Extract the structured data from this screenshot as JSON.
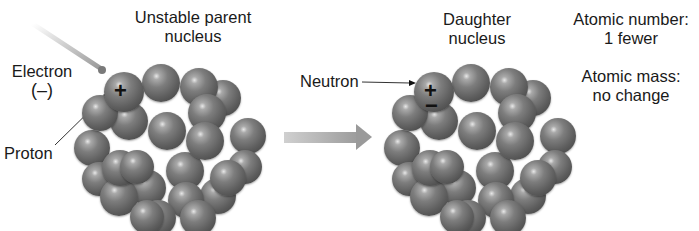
{
  "diagram": {
    "labels": {
      "parent_line1": "Unstable parent",
      "parent_line2": "nucleus",
      "electron_line1": "Electron",
      "electron_line2": "(–)",
      "proton": "Proton",
      "daughter_line1": "Daughter",
      "daughter_line2": "nucleus",
      "neutron": "Neutron",
      "atomic_number_line1": "Atomic number:",
      "atomic_number_line2": "1 fewer",
      "atomic_mass_line1": "Atomic mass:",
      "atomic_mass_line2": "no change"
    },
    "symbols": {
      "plus": "+",
      "minus": "−"
    },
    "colors": {
      "sphere": "#6e6e6e",
      "arrow": "#9a9a9a",
      "text": "#1a1a1a"
    }
  }
}
